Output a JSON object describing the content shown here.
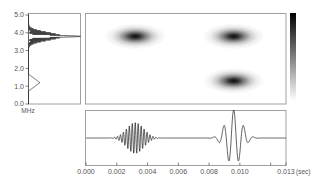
{
  "chart_data": [
    {
      "id": "spectrum",
      "type": "line",
      "title": "",
      "orientation": "vertical",
      "xlabel": "",
      "ylabel": "MHz",
      "ylim": [
        0,
        5
      ],
      "yticks": [
        0.0,
        1.0,
        2.0,
        3.0,
        4.0,
        5.0
      ],
      "ytick_labels": [
        "0.0",
        "1.0",
        "2.0",
        "3.0",
        "4.0",
        "5.0"
      ],
      "amplitude_range": [
        0,
        1
      ],
      "components": [
        {
          "name": "peak-high",
          "center_mhz": 3.8,
          "amplitude": 1.0,
          "width_mhz": 0.05,
          "ripple": true
        },
        {
          "name": "peak-low",
          "center_mhz": 1.2,
          "amplitude": 0.22,
          "width_mhz": 0.25,
          "ripple": false
        }
      ]
    },
    {
      "id": "spectrogram",
      "type": "heatmap",
      "title": "",
      "xlim": [
        0,
        0.013
      ],
      "ylim": [
        0,
        5
      ],
      "colormap": [
        "#ffffff",
        "#000000"
      ],
      "blobs": [
        {
          "time_s": 0.0032,
          "freq_mhz": 3.8,
          "intensity": 1.0
        },
        {
          "time_s": 0.0096,
          "freq_mhz": 3.8,
          "intensity": 1.0
        },
        {
          "time_s": 0.0096,
          "freq_mhz": 1.3,
          "intensity": 1.0
        }
      ]
    },
    {
      "id": "colorbar",
      "type": "heatmap",
      "range": [
        0,
        1
      ],
      "colors": [
        "#ffffff",
        "#000000"
      ]
    },
    {
      "id": "waveform",
      "type": "line",
      "title": "",
      "xlabel": "(sec)",
      "ylabel": "",
      "xlim": [
        0,
        0.013
      ],
      "ylim": [
        -1,
        1
      ],
      "xticks": [
        0.0,
        0.002,
        0.004,
        0.006,
        0.008,
        0.01,
        0.012,
        0.013
      ],
      "xtick_labels": [
        "0.000",
        "0.002",
        "0.004",
        "0.006",
        "0.008",
        "0.010",
        "",
        "0.013"
      ],
      "packets": [
        {
          "name": "burst-1",
          "center_s": 0.0032,
          "freq_mhz": 3.8,
          "amplitude": 0.55,
          "sigma_s": 0.00055,
          "display_cycles_per_ms": 5.2
        },
        {
          "name": "burst-2",
          "center_s": 0.0096,
          "freq_mhz": 1.3,
          "amplitude": 1.0,
          "sigma_s": 0.0005,
          "display_cycles_per_ms": 1.55
        }
      ]
    }
  ],
  "labels": {
    "freq_unit": "MHz",
    "time_unit": "(sec)"
  }
}
